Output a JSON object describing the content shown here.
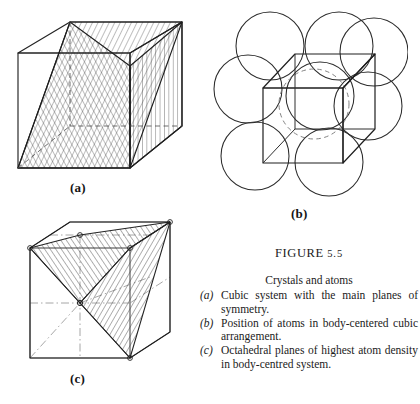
{
  "figure": {
    "header_word": "Figure",
    "header_number": "5.5",
    "title": "Crystals and atoms",
    "items": [
      {
        "marker": "(a)",
        "text": "Cubic system with the main planes of symmetry."
      },
      {
        "marker": "(b)",
        "text": "Position of atoms in body-centered cubic arrangement."
      },
      {
        "marker": "(c)",
        "text": "Octahedral planes of highest atom density in body-centred system."
      }
    ]
  },
  "panels": [
    {
      "id": "a",
      "label": "(a)",
      "name": "cubic-system-planes-of-symmetry",
      "description": "Cube in perspective with two intersecting hatched diagonal planes of symmetry"
    },
    {
      "id": "b",
      "label": "(b)",
      "name": "body-centered-cubic-atom-positions",
      "description": "Perspective cube with eight corner atom circles and one dashed central atom"
    },
    {
      "id": "c",
      "label": "(c)",
      "name": "octahedral-planes-body-centred",
      "description": "Cube with dash-dot axes and hatched octahedral plane of highest atom density"
    }
  ],
  "colors": {
    "ink": "#1a1a1a",
    "line": "#2b2b2b",
    "hatch": "#3a3a3a",
    "dashed": "#6a6a6a",
    "paper": "#ffffff"
  }
}
